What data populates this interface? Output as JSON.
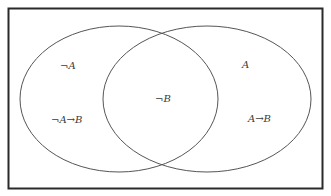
{
  "diagram": {
    "type": "venn",
    "frame": {
      "x": 8,
      "y": 8,
      "width": 315,
      "height": 181,
      "stroke": "#2a2a2a"
    },
    "circles": [
      {
        "name": "left",
        "cx": 119,
        "cy": 99,
        "rx": 99,
        "ry": 73,
        "stroke": "#555555"
      },
      {
        "name": "right",
        "cx": 207,
        "cy": 99,
        "rx": 104,
        "ry": 73,
        "stroke": "#555555"
      }
    ],
    "labels": {
      "left_top": "¬A",
      "left_bottom": "¬A→B",
      "center": "¬B",
      "right_top": "A",
      "right_bottom": "A→B"
    }
  }
}
